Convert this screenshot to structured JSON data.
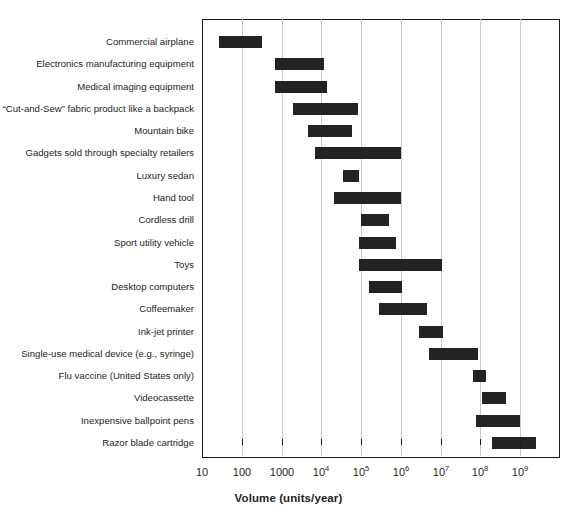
{
  "chart_data": {
    "type": "bar",
    "orientation": "horizontal-range",
    "title": "",
    "xlabel": "Volume (units/year)",
    "ylabel": "",
    "xscale": "log",
    "xlim": [
      10,
      10000000000
    ],
    "grid": true,
    "legend": false,
    "xticks": [
      {
        "value": 10,
        "label": "10"
      },
      {
        "value": 100,
        "label": "100"
      },
      {
        "value": 1000,
        "label": "1000"
      },
      {
        "value": 10000,
        "label": "10",
        "exp": "4"
      },
      {
        "value": 100000,
        "label": "10",
        "exp": "5"
      },
      {
        "value": 1000000,
        "label": "10",
        "exp": "6"
      },
      {
        "value": 10000000,
        "label": "10",
        "exp": "7"
      },
      {
        "value": 100000000,
        "label": "10",
        "exp": "8"
      },
      {
        "value": 1000000000,
        "label": "10",
        "exp": "9"
      }
    ],
    "categories": [
      "Commercial airplane",
      "Electronics manufacturing equipment",
      "Medical imaging equipment",
      "“Cut-and-Sew” fabric product like a backpack",
      "Mountain bike",
      "Gadgets sold through specialty retailers",
      "Luxury sedan",
      "Hand tool",
      "Cordless drill",
      "Sport utility vehicle",
      "Toys",
      "Desktop computers",
      "Coffeemaker",
      "Ink-jet printer",
      "Single-use medical device (e.g., syringe)",
      "Flu vaccine (United States only)",
      "Videocassette",
      "Inexpensive ballpoint pens",
      "Razor blade cartridge"
    ],
    "ranges": [
      {
        "category": "Commercial airplane",
        "low": 26,
        "high": 320
      },
      {
        "category": "Electronics manufacturing equipment",
        "low": 700,
        "high": 12000
      },
      {
        "category": "Medical imaging equipment",
        "low": 700,
        "high": 14000
      },
      {
        "category": "“Cut-and-Sew” fabric product like a backpack",
        "low": 1900,
        "high": 80000
      },
      {
        "category": "Mountain bike",
        "low": 4700,
        "high": 60000
      },
      {
        "category": "Gadgets sold through specialty retailers",
        "low": 6800,
        "high": 1000000
      },
      {
        "category": "Luxury sedan",
        "low": 35000,
        "high": 90000
      },
      {
        "category": "Hand tool",
        "low": 21000,
        "high": 1000000
      },
      {
        "category": "Cordless drill",
        "low": 100000,
        "high": 500000
      },
      {
        "category": "Sport utility vehicle",
        "low": 90000,
        "high": 750000
      },
      {
        "category": "Toys",
        "low": 90000,
        "high": 11000000
      },
      {
        "category": "Desktop computers",
        "low": 160000,
        "high": 1100000
      },
      {
        "category": "Coffeemaker",
        "low": 280000,
        "high": 4500000
      },
      {
        "category": "Ink-jet printer",
        "low": 2800000,
        "high": 11000000
      },
      {
        "category": "Single-use medical device (e.g., syringe)",
        "low": 5000000,
        "high": 85000000
      },
      {
        "category": "Flu vaccine (United States only)",
        "low": 65000000,
        "high": 140000000
      },
      {
        "category": "Videocassette",
        "low": 110000000,
        "high": 450000000
      },
      {
        "category": "Inexpensive ballpoint pens",
        "low": 78000000,
        "high": 1000000000
      },
      {
        "category": "Razor blade cartridge",
        "low": 200000000,
        "high": 2600000000
      }
    ]
  },
  "style": {
    "bar_color": "#232323",
    "grid_color": "#c9c9c9",
    "axis_color": "#1a1a1a",
    "text_color": "#231f20"
  }
}
